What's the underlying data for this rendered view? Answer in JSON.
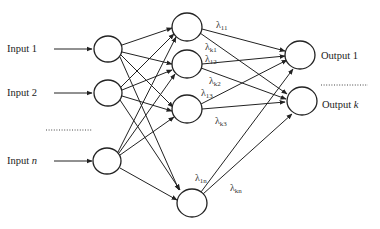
{
  "diagram": {
    "type": "neural-network",
    "inputs": [
      {
        "label": "Input 1",
        "italic_part": ""
      },
      {
        "label": "Input 2",
        "italic_part": ""
      },
      {
        "label": "Input ",
        "italic_part": "n"
      }
    ],
    "input_ellipsis": "..............",
    "outputs": [
      {
        "label": "Output 1",
        "italic_part": ""
      },
      {
        "label": "Output ",
        "italic_part": "k"
      }
    ],
    "output_ellipsis": "..............",
    "weights": [
      {
        "symbol": "λ",
        "sub": "11"
      },
      {
        "symbol": "λ",
        "sub": "k1"
      },
      {
        "symbol": "λ",
        "sub": "12"
      },
      {
        "symbol": "λ",
        "sub": "k2"
      },
      {
        "symbol": "λ",
        "sub": "13"
      },
      {
        "symbol": "λ",
        "sub": "k3"
      },
      {
        "symbol": "λ",
        "sub": "1n"
      },
      {
        "symbol": "λ",
        "sub": "kn"
      }
    ],
    "layers": {
      "input_nodes": 3,
      "hidden_nodes": 4,
      "output_nodes": 2
    }
  }
}
